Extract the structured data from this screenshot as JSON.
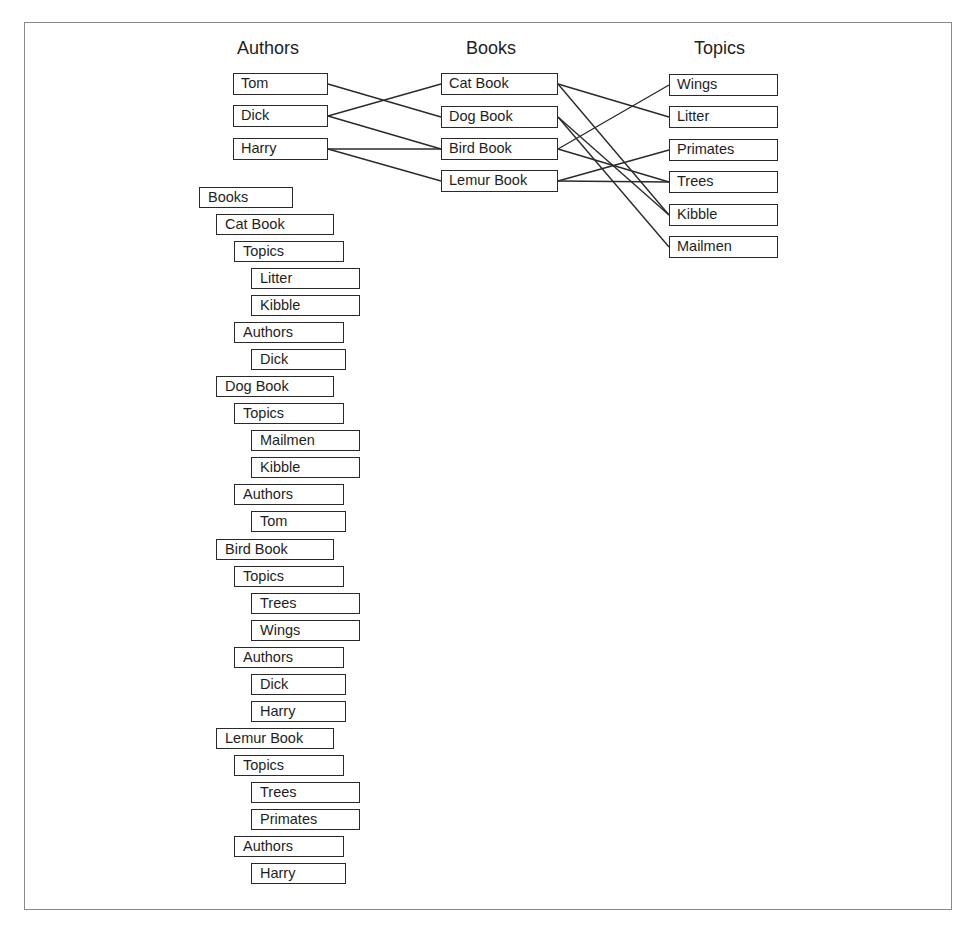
{
  "graph": {
    "columns": [
      {
        "id": "authors",
        "title": "Authors",
        "x": 237,
        "box_x": 233,
        "box_w": 95,
        "nodes": [
          {
            "id": "tom",
            "label": "Tom",
            "y": 73
          },
          {
            "id": "dick",
            "label": "Dick",
            "y": 105
          },
          {
            "id": "harry",
            "label": "Harry",
            "y": 138
          }
        ]
      },
      {
        "id": "books",
        "title": "Books",
        "x": 466,
        "box_x": 441,
        "box_w": 117,
        "nodes": [
          {
            "id": "cat",
            "label": "Cat Book",
            "y": 73
          },
          {
            "id": "dog",
            "label": "Dog Book",
            "y": 106
          },
          {
            "id": "bird",
            "label": "Bird Book",
            "y": 138
          },
          {
            "id": "lemur",
            "label": "Lemur Book",
            "y": 170
          }
        ]
      },
      {
        "id": "topics",
        "title": "Topics",
        "x": 694,
        "box_x": 669,
        "box_w": 109,
        "nodes": [
          {
            "id": "wings",
            "label": "Wings",
            "y": 74
          },
          {
            "id": "litter",
            "label": "Litter",
            "y": 106
          },
          {
            "id": "primates",
            "label": "Primates",
            "y": 139
          },
          {
            "id": "trees",
            "label": "Trees",
            "y": 171
          },
          {
            "id": "kibble",
            "label": "Kibble",
            "y": 204
          },
          {
            "id": "mailmen",
            "label": "Mailmen",
            "y": 236
          }
        ]
      }
    ],
    "edges": [
      [
        "tom",
        "dog"
      ],
      [
        "dick",
        "cat"
      ],
      [
        "dick",
        "bird"
      ],
      [
        "harry",
        "bird"
      ],
      [
        "harry",
        "lemur"
      ],
      [
        "cat",
        "litter"
      ],
      [
        "cat",
        "kibble"
      ],
      [
        "dog",
        "kibble"
      ],
      [
        "dog",
        "mailmen"
      ],
      [
        "bird",
        "wings"
      ],
      [
        "bird",
        "trees"
      ],
      [
        "lemur",
        "primates"
      ],
      [
        "lemur",
        "trees"
      ]
    ]
  },
  "tree": {
    "top": 187,
    "pitch": 27.04,
    "levels": [
      {
        "x": 199,
        "w": 94
      },
      {
        "x": 216,
        "w": 118
      },
      {
        "x": 234,
        "w": 110
      },
      {
        "x": 251,
        "w": 109
      }
    ],
    "author_leaf_w": 95,
    "rows": [
      {
        "label": "Books",
        "level": 0
      },
      {
        "label": "Cat Book",
        "level": 1
      },
      {
        "label": "Topics",
        "level": 2
      },
      {
        "label": "Litter",
        "level": 3
      },
      {
        "label": "Kibble",
        "level": 3
      },
      {
        "label": "Authors",
        "level": 2
      },
      {
        "label": "Dick",
        "level": 3,
        "author": true
      },
      {
        "label": "Dog Book",
        "level": 1
      },
      {
        "label": "Topics",
        "level": 2
      },
      {
        "label": "Mailmen",
        "level": 3
      },
      {
        "label": "Kibble",
        "level": 3
      },
      {
        "label": "Authors",
        "level": 2
      },
      {
        "label": "Tom",
        "level": 3,
        "author": true
      },
      {
        "label": "Bird Book",
        "level": 1
      },
      {
        "label": "Topics",
        "level": 2
      },
      {
        "label": "Trees",
        "level": 3
      },
      {
        "label": "Wings",
        "level": 3
      },
      {
        "label": "Authors",
        "level": 2
      },
      {
        "label": "Dick",
        "level": 3,
        "author": true
      },
      {
        "label": "Harry",
        "level": 3,
        "author": true
      },
      {
        "label": "Lemur Book",
        "level": 1
      },
      {
        "label": "Topics",
        "level": 2
      },
      {
        "label": "Trees",
        "level": 3
      },
      {
        "label": "Primates",
        "level": 3
      },
      {
        "label": "Authors",
        "level": 2
      },
      {
        "label": "Harry",
        "level": 3,
        "author": true
      }
    ]
  }
}
